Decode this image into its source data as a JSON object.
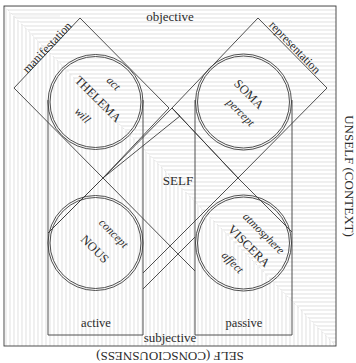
{
  "labels": {
    "top": "objective",
    "bottom": "subjective",
    "right_side": "UNSELF (CONTEXT)",
    "bottom_side": "SELF (CONSCIOUSNESS)",
    "center": "SELF",
    "left_diamond": "manifestation",
    "right_diamond": "representation",
    "left_column": "active",
    "right_column": "passive"
  },
  "circles": [
    {
      "id": "thelema",
      "title": "THELEMA",
      "terms": [
        "act",
        "will"
      ]
    },
    {
      "id": "soma",
      "title": "SOMA",
      "terms": [
        "percept"
      ]
    },
    {
      "id": "nous",
      "title": "NOUS",
      "terms": [
        "concept"
      ]
    },
    {
      "id": "viscera",
      "title": "VISCERA",
      "terms": [
        "atmosphere",
        "affect"
      ]
    }
  ],
  "colors": {
    "line": "#3c3c3c",
    "hatch": "#cfcfcf",
    "text": "#2b2b2b",
    "background": "#ffffff"
  }
}
